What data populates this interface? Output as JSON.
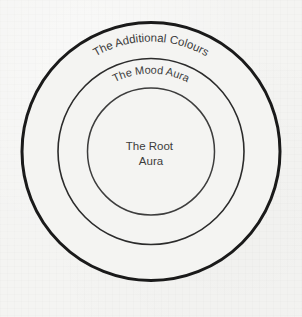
{
  "diagram": {
    "type": "concentric-circles",
    "background_color": "#f4f4f2",
    "text_color": "#3c3c3c",
    "center": {
      "x": 151,
      "y": 151.5
    },
    "rings": [
      {
        "id": "outer",
        "name": "additional-colours-ring",
        "label": "The Additional Colours",
        "label_style": "arc",
        "radius": 129,
        "label_arc_radius": 110,
        "stroke_color": "#1a1a1a",
        "stroke_width": 3,
        "font_size": 11.5
      },
      {
        "id": "middle",
        "name": "mood-aura-ring",
        "label": "The Mood Aura",
        "label_style": "arc",
        "radius": 93,
        "label_arc_radius": 78,
        "stroke_color": "#2b2b2b",
        "stroke_width": 1.6,
        "font_size": 11
      },
      {
        "id": "inner",
        "name": "root-aura-ring",
        "label": "The Root Aura",
        "label_style": "horizontal",
        "label_line1": "The Root",
        "label_line2": "Aura",
        "radius": 63.5,
        "stroke_color": "#3d3d3d",
        "stroke_width": 1.5,
        "font_size": 11.5
      }
    ]
  }
}
